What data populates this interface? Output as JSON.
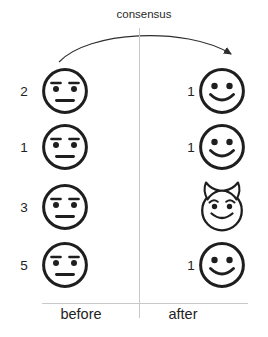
{
  "title": "consensus",
  "columns": {
    "before_label": "before",
    "after_label": "after"
  },
  "rows": [
    {
      "before_count": "2",
      "before_face": "neutral-face",
      "after_count": "1",
      "after_face": "smiley-face"
    },
    {
      "before_count": "1",
      "before_face": "neutral-face",
      "after_count": "1",
      "after_face": "smiley-face"
    },
    {
      "before_count": "3",
      "before_face": "neutral-face",
      "after_count": "",
      "after_face": "devil-face"
    },
    {
      "before_count": "5",
      "before_face": "neutral-face",
      "after_count": "1",
      "after_face": "smiley-face"
    }
  ],
  "colors": {
    "ink": "#1e1e1e",
    "line": "#c8c8c8",
    "arrow": "#2e2e2e",
    "background": "#ffffff"
  }
}
